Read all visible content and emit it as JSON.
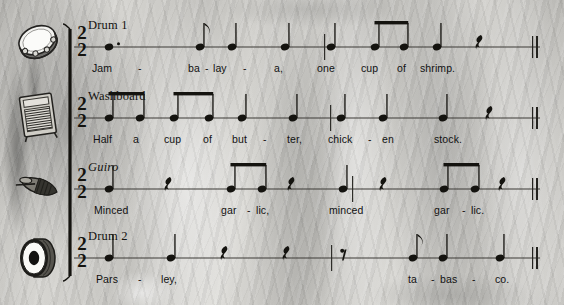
{
  "page": {
    "background_color": "#c8c7c3",
    "ink_color": "#14130f",
    "width": 564,
    "height": 305
  },
  "score": {
    "time_signature": {
      "upper": "2",
      "lower": "2"
    },
    "bracket": "single-system-bracket",
    "final_barline": "double-barline"
  },
  "staves": [
    {
      "id": "drum1",
      "name": "Drum 1",
      "name_style": "roman",
      "icon": "tambourine-icon",
      "icon_label": "tambourine",
      "lyrics": [
        {
          "text": "Jam",
          "x": 92
        },
        {
          "text": "ba",
          "x": 188
        },
        {
          "text": "lay",
          "x": 213
        },
        {
          "text": "a,",
          "x": 274
        },
        {
          "text": "one",
          "x": 317
        },
        {
          "text": "cup",
          "x": 361
        },
        {
          "text": "of",
          "x": 397
        },
        {
          "text": "shrimp.",
          "x": 420
        }
      ],
      "hyphens": [
        {
          "x": 138
        },
        {
          "x": 205
        },
        {
          "x": 243
        }
      ],
      "notes": [
        {
          "x": 109,
          "type": "quarter",
          "dotted": true,
          "stem": "none"
        },
        {
          "x": 200,
          "type": "eighth",
          "dotted": false,
          "stem": "up",
          "flag": true
        },
        {
          "x": 232,
          "type": "quarter",
          "dotted": false,
          "stem": "up"
        },
        {
          "x": 285,
          "type": "quarter",
          "dotted": false,
          "stem": "up"
        },
        {
          "x": 331,
          "type": "quarter",
          "dotted": false,
          "stem": "up"
        },
        {
          "x": 375,
          "type": "eighth",
          "dotted": false,
          "stem": "up",
          "beam": "start"
        },
        {
          "x": 404,
          "type": "eighth",
          "dotted": false,
          "stem": "up",
          "beam": "end"
        },
        {
          "x": 437,
          "type": "quarter",
          "dotted": false,
          "stem": "up"
        }
      ],
      "rests": [
        {
          "x": 480,
          "type": "quarter-rest"
        }
      ],
      "barlines": [
        324
      ]
    },
    {
      "id": "washboard",
      "name": "Washboard",
      "name_style": "roman",
      "icon": "washboard-icon",
      "icon_label": "washboard",
      "lyrics": [
        {
          "text": "Half",
          "x": 93
        },
        {
          "text": "a",
          "x": 133
        },
        {
          "text": "cup",
          "x": 164
        },
        {
          "text": "of",
          "x": 203
        },
        {
          "text": "but",
          "x": 232
        },
        {
          "text": "ter,",
          "x": 287
        },
        {
          "text": "chick",
          "x": 328
        },
        {
          "text": "en",
          "x": 382
        },
        {
          "text": "stock.",
          "x": 434
        }
      ],
      "hyphens": [
        {
          "x": 263
        },
        {
          "x": 368
        }
      ],
      "notes": [
        {
          "x": 109,
          "type": "eighth",
          "stem": "up",
          "beam": "start"
        },
        {
          "x": 140,
          "type": "eighth",
          "stem": "up",
          "beam": "end"
        },
        {
          "x": 174,
          "type": "eighth",
          "stem": "up",
          "beam": "start"
        },
        {
          "x": 209,
          "type": "eighth",
          "stem": "up",
          "beam": "end"
        },
        {
          "x": 242,
          "type": "quarter",
          "stem": "up"
        },
        {
          "x": 293,
          "type": "quarter",
          "stem": "up"
        },
        {
          "x": 341,
          "type": "quarter",
          "stem": "up"
        },
        {
          "x": 383,
          "type": "quarter",
          "stem": "up"
        },
        {
          "x": 443,
          "type": "quarter",
          "stem": "up"
        }
      ],
      "rests": [
        {
          "x": 490,
          "type": "quarter-rest"
        }
      ],
      "barlines": [
        330
      ]
    },
    {
      "id": "guiro",
      "name": "Guiro",
      "name_style": "italic",
      "icon": "guiro-icon",
      "icon_label": "guiro scraper",
      "lyrics": [
        {
          "text": "Minced",
          "x": 94
        },
        {
          "text": "gar",
          "x": 221
        },
        {
          "text": "lic,",
          "x": 256
        },
        {
          "text": "minced",
          "x": 329
        },
        {
          "text": "gar",
          "x": 434
        },
        {
          "text": "lic.",
          "x": 471
        }
      ],
      "hyphens": [
        {
          "x": 247
        },
        {
          "x": 462
        }
      ],
      "notes": [
        {
          "x": 109,
          "type": "quarter",
          "stem": "up"
        },
        {
          "x": 231,
          "type": "eighth",
          "stem": "up",
          "beam": "start"
        },
        {
          "x": 262,
          "type": "eighth",
          "stem": "up",
          "beam": "end"
        },
        {
          "x": 343,
          "type": "quarter",
          "stem": "up"
        },
        {
          "x": 444,
          "type": "eighth",
          "stem": "up",
          "beam": "start"
        },
        {
          "x": 475,
          "type": "eighth",
          "stem": "up",
          "beam": "end"
        }
      ],
      "rests": [
        {
          "x": 169,
          "type": "quarter-rest"
        },
        {
          "x": 292,
          "type": "quarter-rest"
        },
        {
          "x": 384,
          "type": "quarter-rest"
        },
        {
          "x": 503,
          "type": "quarter-rest"
        }
      ],
      "barlines": [
        352
      ]
    },
    {
      "id": "drum2",
      "name": "Drum 2",
      "name_style": "roman",
      "icon": "bass-drum-icon",
      "icon_label": "bass drum",
      "lyrics": [
        {
          "text": "Pars",
          "x": 96
        },
        {
          "text": "ley,",
          "x": 161
        },
        {
          "text": "ta",
          "x": 408
        },
        {
          "text": "bas",
          "x": 440
        },
        {
          "text": "co.",
          "x": 495
        }
      ],
      "hyphens": [
        {
          "x": 138
        },
        {
          "x": 431
        },
        {
          "x": 472
        }
      ],
      "notes": [
        {
          "x": 109,
          "type": "quarter",
          "stem": "up"
        },
        {
          "x": 171,
          "type": "quarter",
          "stem": "up"
        },
        {
          "x": 413,
          "type": "eighth",
          "stem": "up",
          "flag": true
        },
        {
          "x": 443,
          "type": "quarter",
          "stem": "up"
        },
        {
          "x": 500,
          "type": "quarter",
          "stem": "up"
        }
      ],
      "rests": [
        {
          "x": 225,
          "type": "quarter-rest"
        },
        {
          "x": 287,
          "type": "quarter-rest"
        },
        {
          "x": 341,
          "type": "eighth-rest"
        }
      ],
      "barlines": [
        331
      ]
    }
  ]
}
